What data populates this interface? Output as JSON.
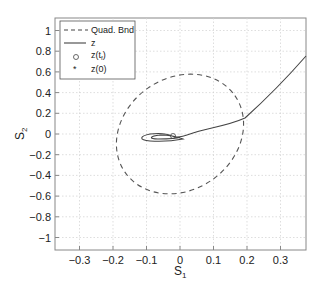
{
  "chart_data": {
    "type": "line",
    "title": "",
    "xlabel": "S1",
    "ylabel": "S2",
    "xlim": [
      -0.37,
      0.38
    ],
    "ylim": [
      -1.12,
      1.12
    ],
    "grid": true,
    "legend_position": "upper left",
    "x_ticks": [
      "-0.3",
      "-0.2",
      "-0.1",
      "0",
      "0.1",
      "0.2",
      "0.3"
    ],
    "y_ticks": [
      "1",
      "0.8",
      "0.6",
      "0.4",
      "0.2",
      "0",
      "-0.2",
      "-0.4",
      "-0.6",
      "-0.8",
      "-1"
    ],
    "legend": [
      "Quad. Bnd",
      "z",
      "z(t_f)",
      "z(0)"
    ],
    "series": [
      {
        "name": "Quad. Bnd",
        "style": "dashed",
        "shape": "tilted ellipse",
        "x": [
          -0.2,
          -0.15,
          -0.05,
          0.05,
          0.12,
          0.2,
          0.18,
          0.1,
          0.0,
          -0.08,
          -0.17,
          -0.2
        ],
        "y": [
          0.0,
          0.35,
          0.52,
          0.55,
          0.45,
          0.05,
          -0.2,
          -0.45,
          -0.56,
          -0.55,
          -0.3,
          0.0
        ]
      },
      {
        "name": "z",
        "style": "solid",
        "x": [
          0.38,
          0.3,
          0.2,
          0.1,
          0.05,
          0.0,
          -0.02,
          -0.05,
          -0.08,
          -0.12,
          -0.1,
          -0.05,
          -0.02
        ],
        "y": [
          0.75,
          0.45,
          0.2,
          0.1,
          0.05,
          0.0,
          -0.03,
          -0.02,
          0.0,
          -0.05,
          -0.07,
          -0.06,
          -0.04
        ]
      },
      {
        "name": "z(t_f)",
        "marker": "circle",
        "x": [
          -0.02
        ],
        "y": [
          -0.02
        ]
      },
      {
        "name": "z(0)",
        "marker": "asterisk",
        "x": [
          0.38
        ],
        "y": [
          0.75
        ]
      }
    ]
  },
  "labels": {
    "xlabel_main": "S",
    "xlabel_sub": "1",
    "ylabel_main": "S",
    "ylabel_sub": "2",
    "legend_0": "Quad. Bnd",
    "legend_1": "z",
    "legend_2_main": "z(t",
    "legend_2_sub": "f",
    "legend_2_end": ")",
    "legend_3": "z(0)"
  }
}
